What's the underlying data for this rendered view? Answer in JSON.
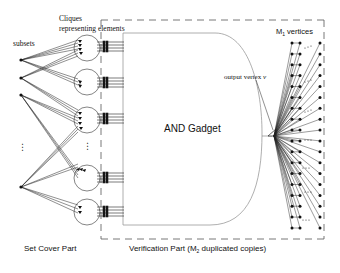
{
  "labels": {
    "subsets": "subsets",
    "cliques_line1": "Cliques",
    "cliques_line2": "representing elements",
    "m1_vertices": "M",
    "m1_sub": "1",
    "m1_rest": " vertices",
    "output_vertex": "output vertex ",
    "output_vertex_var": "v",
    "and_gadget": "AND Gadget",
    "set_cover_part": "Set Cover Part",
    "verification_part_pre": "Verification Part (M",
    "verification_part_sub": "2",
    "verification_part_post": " duplicated copies)",
    "left_ellipsis": "⋮",
    "clique_ellipsis": "⋮",
    "row_ellipsis": "⋯"
  },
  "colors": {
    "stroke": "#222222",
    "border_dash": "#555555",
    "gadget_outline": "#9a9a9a",
    "text": "#111111"
  },
  "structure": {
    "subset_nodes": 4,
    "clique_circles": 5,
    "vertex_columns": 3,
    "vertex_rows": 18
  }
}
